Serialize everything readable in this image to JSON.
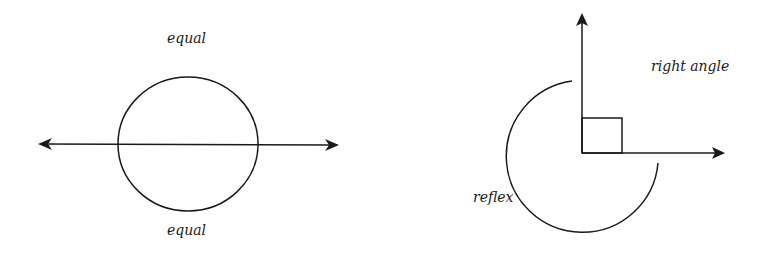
{
  "figures": {
    "left": {
      "top_label": "equal",
      "bottom_label": "equal",
      "description": "circle bisected by a double-headed line into two equal halves"
    },
    "right": {
      "right_angle_label": "right angle",
      "reflex_label": "reflex",
      "description": "two perpendicular rays with right-angle marker and reflex arc"
    }
  },
  "colors": {
    "stroke": "#1a1a1a",
    "background": "#ffffff"
  }
}
